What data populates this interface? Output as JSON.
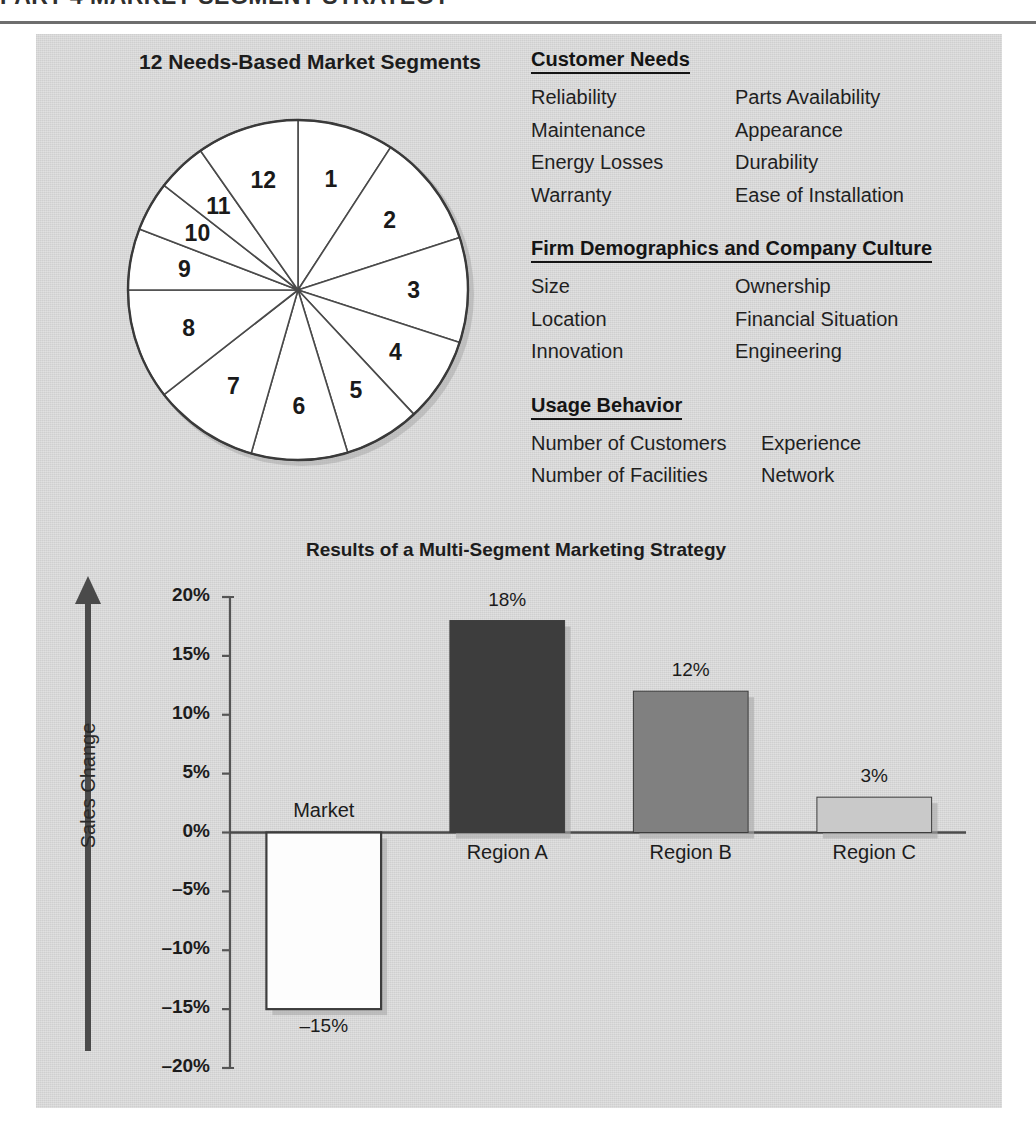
{
  "chapter_header": "PART 4  MARKET-SEGMENT STRATEGY",
  "pie": {
    "title": "12 Needs-Based Market Segments",
    "segments": [
      {
        "label": "1",
        "start_deg": 0,
        "end_deg": 33
      },
      {
        "label": "2",
        "start_deg": 33,
        "end_deg": 72
      },
      {
        "label": "3",
        "start_deg": 72,
        "end_deg": 108
      },
      {
        "label": "4",
        "start_deg": 108,
        "end_deg": 137
      },
      {
        "label": "5",
        "start_deg": 137,
        "end_deg": 163
      },
      {
        "label": "6",
        "start_deg": 163,
        "end_deg": 196
      },
      {
        "label": "7",
        "start_deg": 196,
        "end_deg": 232
      },
      {
        "label": "8",
        "start_deg": 232,
        "end_deg": 270
      },
      {
        "label": "9",
        "start_deg": 270,
        "end_deg": 291
      },
      {
        "label": "10",
        "start_deg": 291,
        "end_deg": 308
      },
      {
        "label": "11",
        "start_deg": 308,
        "end_deg": 325
      },
      {
        "label": "12",
        "start_deg": 325,
        "end_deg": 360
      }
    ]
  },
  "lists": [
    {
      "heading": "Customer Needs",
      "rows": [
        [
          "Reliability",
          "Parts Availability"
        ],
        [
          "Maintenance",
          "Appearance"
        ],
        [
          "Energy Losses",
          "Durability"
        ],
        [
          "Warranty",
          "Ease of Installation"
        ]
      ]
    },
    {
      "heading": "Firm Demographics and Company Culture",
      "rows": [
        [
          "Size",
          "Ownership"
        ],
        [
          "Location",
          "Financial Situation"
        ],
        [
          "Innovation",
          "Engineering"
        ]
      ]
    },
    {
      "heading": "Usage Behavior",
      "rows": [
        [
          "Number of Customers",
          "Experience"
        ],
        [
          "Number of Facilities",
          "Network"
        ]
      ]
    }
  ],
  "chart_data": {
    "type": "bar",
    "title": "Results of a Multi-Segment Marketing Strategy",
    "xlabel": "",
    "ylabel": "Sales Change",
    "categories": [
      "Market",
      "Region A",
      "Region B",
      "Region C"
    ],
    "values": [
      -15,
      18,
      12,
      3
    ],
    "value_labels": [
      "–15%",
      "18%",
      "12%",
      "3%"
    ],
    "bar_colors": [
      "#fdfdfd",
      "#3d3d3d",
      "#808080",
      "#c9c9c9"
    ],
    "ylim": [
      -20,
      20
    ],
    "yticks": [
      20,
      15,
      10,
      5,
      0,
      -5,
      -10,
      -15,
      -20
    ],
    "ytick_labels": [
      "20%",
      "15%",
      "10%",
      "5%",
      "0%",
      "–5%",
      "–10%",
      "–15%",
      "–20%"
    ],
    "grid": false,
    "legend": "none",
    "axis_arrow_direction": "up"
  },
  "colors": {
    "panel_bg": "#d7d7d7",
    "ink": "#1c1c1c",
    "axis": "#555555",
    "bar_dark": "#3d3d3d",
    "bar_mid": "#808080",
    "bar_light": "#c9c9c9",
    "bar_white": "#fdfdfd"
  }
}
